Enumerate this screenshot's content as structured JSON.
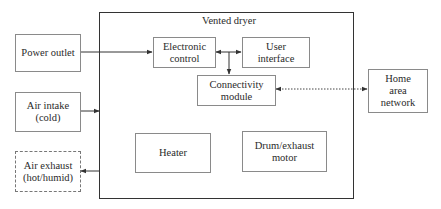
{
  "diagram": {
    "container": {
      "id": "vented-dryer",
      "label": "Vented dryer"
    },
    "external_nodes": [
      {
        "id": "power-outlet",
        "label": "Power outlet",
        "border": "solid"
      },
      {
        "id": "air-intake",
        "label": "Air intake\n(cold)",
        "border": "solid"
      },
      {
        "id": "air-exhaust",
        "label": "Air exhaust\n(hot/humid)",
        "border": "dashed"
      },
      {
        "id": "home-area-network",
        "label": "Home\narea\nnetwork",
        "border": "solid"
      }
    ],
    "internal_nodes": [
      {
        "id": "electronic-control",
        "label": "Electronic\ncontrol"
      },
      {
        "id": "user-interface",
        "label": "User\ninterface"
      },
      {
        "id": "connectivity-module",
        "label": "Connectivity\nmodule"
      },
      {
        "id": "heater",
        "label": "Heater"
      },
      {
        "id": "drum-exhaust-motor",
        "label": "Drum/exhaust\nmotor"
      }
    ],
    "edges": [
      {
        "from": "power-outlet",
        "to": "electronic-control",
        "style": "solid",
        "direction": "forward"
      },
      {
        "from": "electronic-control",
        "to": "user-interface",
        "style": "solid",
        "direction": "both"
      },
      {
        "from": "electronic-control",
        "to": "connectivity-module",
        "style": "solid",
        "direction": "forward"
      },
      {
        "from": "connectivity-module",
        "to": "home-area-network",
        "style": "dotted",
        "direction": "both"
      },
      {
        "from": "air-intake",
        "to": "vented-dryer",
        "style": "solid",
        "direction": "forward"
      },
      {
        "from": "vented-dryer",
        "to": "air-exhaust",
        "style": "solid",
        "direction": "forward"
      }
    ]
  }
}
